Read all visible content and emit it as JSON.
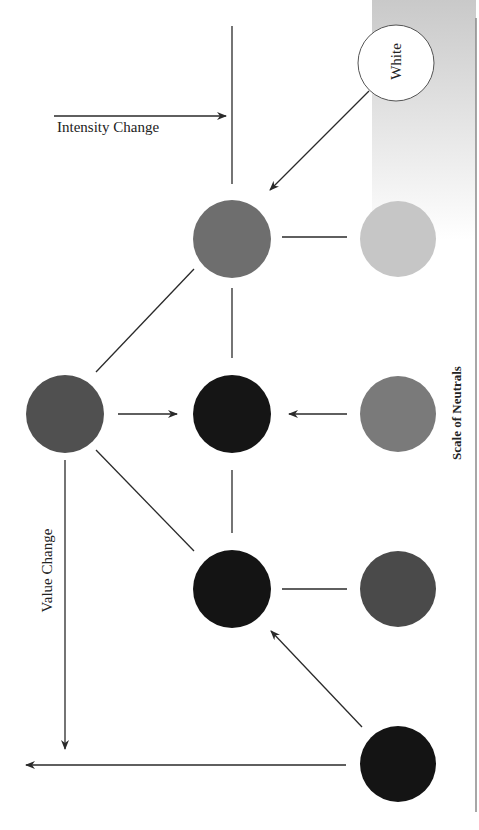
{
  "diagram": {
    "title": "Scale of Neutrals",
    "labels": {
      "intensity_change": "Intensity Change",
      "value_change": "Value Change",
      "white": "White",
      "scale_of_neutrals": "Scale of Neutrals"
    },
    "colors": {
      "background": "#ffffff",
      "gradient_top": "#c9c9c9",
      "gradient_bottom": "#ffffff",
      "line": "#2a2a2a"
    },
    "nodes": [
      {
        "id": "white",
        "label": "White",
        "cx": 396,
        "cy": 63,
        "r": 38,
        "fill": "#ffffff",
        "stroke": "#555555"
      },
      {
        "id": "neutral-light",
        "cx": 398,
        "cy": 239,
        "r": 38,
        "fill": "#c6c6c6"
      },
      {
        "id": "neutral-mid",
        "cx": 398,
        "cy": 414,
        "r": 38,
        "fill": "#7a7a7a"
      },
      {
        "id": "neutral-dark",
        "cx": 398,
        "cy": 589,
        "r": 38,
        "fill": "#4a4a4a"
      },
      {
        "id": "neutral-black",
        "cx": 398,
        "cy": 764,
        "r": 38,
        "fill": "#141414"
      },
      {
        "id": "hue-top",
        "cx": 232,
        "cy": 239,
        "r": 39,
        "fill": "#6e6e6e"
      },
      {
        "id": "hue-center",
        "cx": 232,
        "cy": 414,
        "r": 39,
        "fill": "#151515"
      },
      {
        "id": "hue-lower",
        "cx": 232,
        "cy": 589,
        "r": 39,
        "fill": "#141414"
      },
      {
        "id": "hue-full",
        "cx": 65,
        "cy": 414,
        "r": 39,
        "fill": "#505050"
      }
    ]
  }
}
